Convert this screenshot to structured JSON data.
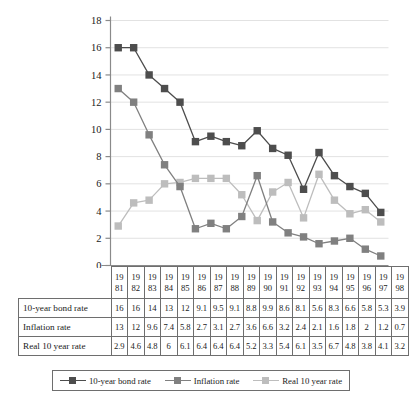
{
  "chart_data": {
    "type": "line",
    "title": "",
    "xlabel": "",
    "ylabel": "",
    "ylim": [
      0,
      18
    ],
    "ytick_step": 2,
    "yticks": [
      18,
      16,
      14,
      12,
      10,
      8,
      6,
      4,
      2,
      0
    ],
    "grid": true,
    "legend_position": "bottom",
    "categories": [
      "1981",
      "1982",
      "1983",
      "1984",
      "1985",
      "1986",
      "1987",
      "1988",
      "1989",
      "1990",
      "1991",
      "1992",
      "1993",
      "1994",
      "1995",
      "1996",
      "1997",
      "1998"
    ],
    "category_lines": [
      {
        "top": "19",
        "bottom": "81"
      },
      {
        "top": "19",
        "bottom": "82"
      },
      {
        "top": "19",
        "bottom": "83"
      },
      {
        "top": "19",
        "bottom": "84"
      },
      {
        "top": "19",
        "bottom": "85"
      },
      {
        "top": "19",
        "bottom": "86"
      },
      {
        "top": "19",
        "bottom": "87"
      },
      {
        "top": "19",
        "bottom": "88"
      },
      {
        "top": "19",
        "bottom": "89"
      },
      {
        "top": "19",
        "bottom": "90"
      },
      {
        "top": "19",
        "bottom": "91"
      },
      {
        "top": "19",
        "bottom": "92"
      },
      {
        "top": "19",
        "bottom": "93"
      },
      {
        "top": "19",
        "bottom": "94"
      },
      {
        "top": "19",
        "bottom": "95"
      },
      {
        "top": "19",
        "bottom": "96"
      },
      {
        "top": "19",
        "bottom": "97"
      },
      {
        "top": "19",
        "bottom": "98"
      }
    ],
    "series": [
      {
        "name": "10-year bond rate",
        "color": "#4d4d4d",
        "values": [
          16,
          16,
          14,
          13,
          12,
          9.1,
          9.5,
          9.1,
          8.8,
          9.9,
          8.6,
          8.1,
          5.6,
          8.3,
          6.6,
          5.8,
          5.3,
          3.9
        ],
        "labels": [
          "16",
          "16",
          "14",
          "13",
          "12",
          "9.1",
          "9.5",
          "9.1",
          "8.8",
          "9.9",
          "8.6",
          "8.1",
          "5.6",
          "8.3",
          "6.6",
          "5.8",
          "5.3",
          "3.9"
        ]
      },
      {
        "name": "Inflation rate",
        "color": "#808080",
        "values": [
          13,
          12,
          9.6,
          7.4,
          5.8,
          2.7,
          3.1,
          2.7,
          3.6,
          6.6,
          3.2,
          2.4,
          2.1,
          1.6,
          1.8,
          2,
          1.2,
          0.7
        ],
        "labels": [
          "13",
          "12",
          "9.6",
          "7.4",
          "5.8",
          "2.7",
          "3.1",
          "2.7",
          "3.6",
          "6.6",
          "3.2",
          "2.4",
          "2.1",
          "1.6",
          "1.8",
          "2",
          "1.2",
          "0.7"
        ]
      },
      {
        "name": "Real 10 year rate",
        "color": "#bdbdbd",
        "values": [
          2.9,
          4.6,
          4.8,
          6,
          6.1,
          6.4,
          6.4,
          6.4,
          5.2,
          3.3,
          5.4,
          6.1,
          3.5,
          6.7,
          4.8,
          3.8,
          4.1,
          3.2
        ],
        "labels": [
          "2.9",
          "4.6",
          "4.8",
          "6",
          "6.1",
          "6.4",
          "6.4",
          "6.4",
          "5.2",
          "3.3",
          "5.4",
          "6.1",
          "3.5",
          "6.7",
          "4.8",
          "3.8",
          "4.1",
          "3.2"
        ]
      }
    ]
  },
  "table": {
    "corner_label": "",
    "rows": [
      {
        "label": "10-year bond rate"
      },
      {
        "label": "Inflation rate"
      },
      {
        "label": "Real 10 year rate"
      }
    ]
  },
  "legend": {
    "items": [
      {
        "label": "10-year bond rate",
        "color": "#4d4d4d"
      },
      {
        "label": "Inflation rate",
        "color": "#808080"
      },
      {
        "label": "Real 10 year rate",
        "color": "#bdbdbd"
      }
    ]
  },
  "axis": {
    "zero_label": "0"
  }
}
